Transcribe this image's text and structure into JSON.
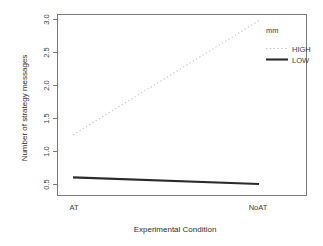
{
  "chart_data": {
    "type": "line",
    "title": "",
    "subtitle": "",
    "xlabel": "Experimental Condition",
    "ylabel": "Number of strategy messages",
    "categories": [
      "AT",
      "NoAT"
    ],
    "x": [
      0,
      1
    ],
    "series": [
      {
        "name": "HIGH",
        "values": [
          1.3,
          3.02
        ],
        "linestyle": "dotted",
        "color": "#c8c8c8"
      },
      {
        "name": "LOW",
        "values": [
          0.66,
          0.56
        ],
        "linestyle": "solid",
        "color": "#2b2b2b"
      }
    ],
    "ylim": [
      0.38,
      3.12
    ],
    "xlim": [
      -0.12,
      1.12
    ],
    "yticks": [
      "0.5",
      "1.0",
      "1.5",
      "2.0",
      "2.5",
      "3.0"
    ],
    "ytick_values": [
      0.5,
      1.0,
      1.5,
      2.0,
      2.5,
      3.0
    ],
    "xticks": [
      "AT",
      "NoAT"
    ],
    "grid": false,
    "legend": {
      "title": "mm",
      "position": "upper-right",
      "entries": [
        {
          "label": "HIGH",
          "linestyle": "dotted",
          "color": "#c8c8c8"
        },
        {
          "label": "LOW",
          "linestyle": "solid",
          "color": "#2b2b2b"
        }
      ]
    },
    "box_border_color": "#6e6e6e",
    "background_color": "#ffffff"
  },
  "axes": {
    "y_label": "Number of strategy messages",
    "x_label": "Experimental Condition",
    "y_tick_labels": {
      "t0": "0.5",
      "t1": "1.0",
      "t2": "1.5",
      "t3": "2.0",
      "t4": "2.5",
      "t5": "3.0"
    },
    "x_tick_labels": {
      "t0": "AT",
      "t1": "NoAT"
    }
  },
  "legend": {
    "title": "mm",
    "high_label": "HIGH",
    "low_label": "LOW"
  }
}
